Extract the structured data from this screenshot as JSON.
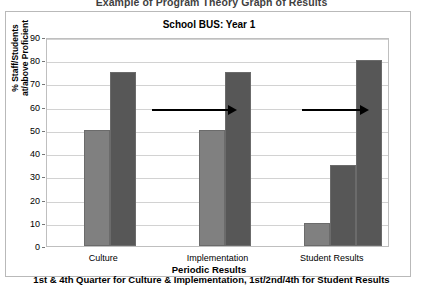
{
  "document": {
    "title": "Example of Program Theory Graph of Results"
  },
  "chart": {
    "title": "School BUS: Year 1",
    "yaxis_label_line1": "% Staff/Students",
    "yaxis_label_line2": "at/above Proficient",
    "xaxis_title": "Periodic Results",
    "xaxis_subtitle": "1st & 4th Quarter for Culture & Implementation, 1st/2nd/4th for Student Results",
    "colors": {
      "light_bar": "#808080",
      "dark_bar": "#575757",
      "bar_outline": "#6b6b6b",
      "gridline": "#d2d2d2",
      "frame": "#b9b9b9",
      "arrow": "#000000"
    }
  },
  "chart_data": {
    "type": "bar",
    "title": "School BUS: Year 1",
    "subtitle": "Example of Program Theory Graph of Results",
    "xlabel": "Periodic Results",
    "xlabel_note": "1st & 4th Quarter for Culture & Implementation, 1st/2nd/4th for Student Results",
    "ylabel": "% Staff/Students at/above Proficient",
    "ylim": [
      0,
      90
    ],
    "ytick_step": 10,
    "yticks": [
      0,
      10,
      20,
      30,
      40,
      50,
      60,
      70,
      80,
      90
    ],
    "grid": true,
    "legend": false,
    "legend_position": "none",
    "categories": [
      "Culture",
      "Implementation",
      "Student Results"
    ],
    "groups": [
      {
        "category": "Culture",
        "bars": [
          {
            "period": "1st Quarter",
            "value": 50,
            "color": "#808080"
          },
          {
            "period": "4th Quarter",
            "value": 75,
            "color": "#575757"
          }
        ]
      },
      {
        "category": "Implementation",
        "bars": [
          {
            "period": "1st Quarter",
            "value": 50,
            "color": "#808080"
          },
          {
            "period": "4th Quarter",
            "value": 75,
            "color": "#575757"
          }
        ]
      },
      {
        "category": "Student Results",
        "bars": [
          {
            "period": "1st",
            "value": 10,
            "color": "#808080"
          },
          {
            "period": "2nd",
            "value": 35,
            "color": "#575757"
          },
          {
            "period": "4th",
            "value": 80,
            "color": "#575757"
          }
        ]
      }
    ],
    "annotations": [
      {
        "type": "arrow",
        "direction": "right",
        "at_value": 60,
        "between": [
          "Culture",
          "Implementation"
        ]
      },
      {
        "type": "arrow",
        "direction": "right",
        "at_value": 60,
        "between": [
          "Implementation",
          "Student Results"
        ]
      }
    ]
  }
}
